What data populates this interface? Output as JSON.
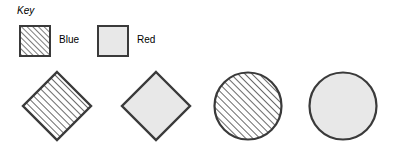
{
  "figure": {
    "background_color": "#ffffff",
    "stroke_color": "#3a3a3a",
    "fill_gray": "#e8e8e8",
    "hatch_color": "#444444"
  },
  "key": {
    "title": "Key",
    "entries": [
      {
        "label": "Blue",
        "pattern": "diagonal-hatch",
        "swatch_name": "key-swatch-blue"
      },
      {
        "label": "Red",
        "pattern": "solid-gray",
        "swatch_name": "key-swatch-red"
      }
    ]
  },
  "shapes": [
    {
      "shape": "diamond",
      "pattern": "diagonal-hatch",
      "series": "Blue"
    },
    {
      "shape": "diamond",
      "pattern": "solid-gray",
      "series": "Red"
    },
    {
      "shape": "circle",
      "pattern": "diagonal-hatch",
      "series": "Blue"
    },
    {
      "shape": "circle",
      "pattern": "solid-gray",
      "series": "Red"
    }
  ]
}
